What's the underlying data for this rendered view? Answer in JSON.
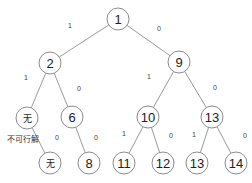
{
  "diagram": {
    "type": "binary-tree",
    "nodes": [
      {
        "id": "n1",
        "label": "1",
        "x": 118,
        "y": 19
      },
      {
        "id": "n2",
        "label": "2",
        "x": 50,
        "y": 63
      },
      {
        "id": "n9",
        "label": "9",
        "x": 179,
        "y": 62
      },
      {
        "id": "n_none1",
        "label": "无",
        "x": 27,
        "y": 118
      },
      {
        "id": "n6",
        "label": "6",
        "x": 72,
        "y": 117
      },
      {
        "id": "n10",
        "label": "10",
        "x": 148,
        "y": 117
      },
      {
        "id": "n13a",
        "label": "13",
        "x": 212,
        "y": 117
      },
      {
        "id": "n_none2",
        "label": "无",
        "x": 50,
        "y": 163
      },
      {
        "id": "n8",
        "label": "8",
        "x": 89,
        "y": 163
      },
      {
        "id": "n11",
        "label": "11",
        "x": 124,
        "y": 163
      },
      {
        "id": "n12",
        "label": "12",
        "x": 163,
        "y": 163
      },
      {
        "id": "n13b",
        "label": "13",
        "x": 197,
        "y": 163
      },
      {
        "id": "n14",
        "label": "14",
        "x": 236,
        "y": 163
      }
    ],
    "edges": [
      {
        "from": "n1",
        "to": "n2",
        "label": "1",
        "lx": 70,
        "ly": 28
      },
      {
        "from": "n1",
        "to": "n9",
        "label": "0",
        "lx": 159,
        "ly": 31
      },
      {
        "from": "n2",
        "to": "n_none1",
        "label": "1",
        "lx": 26,
        "ly": 80
      },
      {
        "from": "n2",
        "to": "n6",
        "label": "0",
        "lx": 79,
        "ly": 91
      },
      {
        "from": "n9",
        "to": "n10",
        "label": "1",
        "lx": 149,
        "ly": 79
      },
      {
        "from": "n9",
        "to": "n13a",
        "label": "0",
        "lx": 215,
        "ly": 90
      },
      {
        "from": "n_none1",
        "to": "n_none2",
        "label": "0",
        "lx": 57,
        "ly": 140
      },
      {
        "from": "n6",
        "to": "n8",
        "label": "0",
        "lx": 96,
        "ly": 140
      },
      {
        "from": "n10",
        "to": "n11",
        "label": "1",
        "lx": 124,
        "ly": 136
      },
      {
        "from": "n10",
        "to": "n12",
        "label": "0",
        "lx": 171,
        "ly": 138
      },
      {
        "from": "n13a",
        "to": "n13b",
        "label": "1",
        "lx": 194,
        "ly": 137
      },
      {
        "from": "n13a",
        "to": "n14",
        "label": "0",
        "lx": 245,
        "ly": 138
      }
    ],
    "annotations": [
      {
        "text": "不可行解",
        "x": 7,
        "y": 138
      }
    ]
  }
}
